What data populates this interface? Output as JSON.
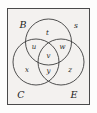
{
  "figure": {
    "background_color": "#f3f1ef",
    "line_color": "#3c3c3c",
    "text_color": "#1c1c1c"
  },
  "universe": {
    "label": "s"
  },
  "sets": [
    {
      "id": "set-b",
      "label": "B",
      "position": "top-left"
    },
    {
      "id": "set-c",
      "label": "C",
      "position": "bottom-left"
    },
    {
      "id": "set-e",
      "label": "E",
      "position": "bottom-right"
    }
  ],
  "regions": [
    {
      "id": "region-t",
      "label": "t",
      "description": "B only"
    },
    {
      "id": "region-u",
      "label": "u",
      "description": "B and C only"
    },
    {
      "id": "region-w",
      "label": "w",
      "description": "B and E only"
    },
    {
      "id": "region-v",
      "label": "v",
      "description": "B and C and E"
    },
    {
      "id": "region-x",
      "label": "x",
      "description": "C only"
    },
    {
      "id": "region-y",
      "label": "y",
      "description": "C and E only"
    },
    {
      "id": "region-z",
      "label": "z",
      "description": "E only"
    }
  ]
}
